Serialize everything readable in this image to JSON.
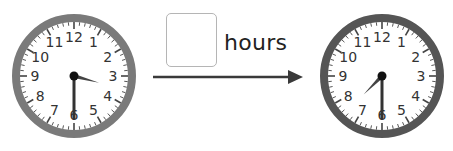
{
  "problem": {
    "unit_label": "hours",
    "answer_box_value": ""
  },
  "clocks": [
    {
      "id": "start",
      "rim_color": "#7a7a7a",
      "time": "3:30",
      "hour_hand_angle_deg": 105,
      "minute_hand_angle_deg": 180,
      "numbers": [
        "12",
        "1",
        "2",
        "3",
        "4",
        "5",
        "6",
        "7",
        "8",
        "9",
        "10",
        "11"
      ]
    },
    {
      "id": "end",
      "rim_color": "#555555",
      "time": "7:30",
      "hour_hand_angle_deg": 225,
      "minute_hand_angle_deg": 180,
      "numbers": [
        "12",
        "1",
        "2",
        "3",
        "4",
        "5",
        "6",
        "7",
        "8",
        "9",
        "10",
        "11"
      ]
    }
  ],
  "arrow": {
    "direction": "right",
    "color": "#3a3a3a"
  }
}
